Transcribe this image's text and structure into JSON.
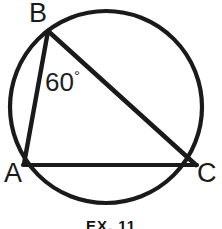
{
  "figure": {
    "caption": "EX. 11",
    "stroke_color": "#1a1a1a",
    "background_color": "#ffffff",
    "labels": {
      "vertex_b": "B",
      "vertex_a": "A",
      "vertex_c": "C",
      "angle_value": "60",
      "angle_unit": "°"
    },
    "shapes": {
      "circle": {
        "name": "circumscribed-circle",
        "center_x": 106,
        "center_y": 107,
        "radius": 96,
        "stroke_width": 4
      },
      "triangle": {
        "name": "inscribed-triangle-abc",
        "points": {
          "a": {
            "x": 24,
            "y": 164
          },
          "b": {
            "x": 48,
            "y": 31
          },
          "c": {
            "x": 196,
            "y": 165
          }
        },
        "stroke_width": 4
      }
    }
  }
}
